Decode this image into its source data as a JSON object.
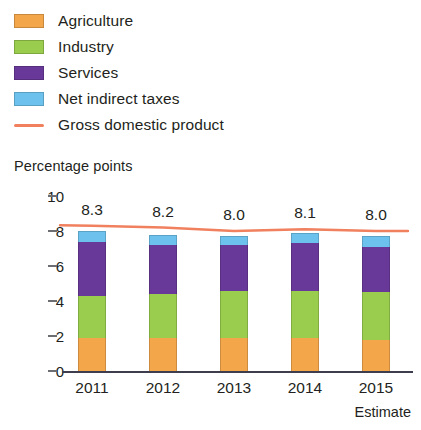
{
  "legend": {
    "items": [
      {
        "label": "Agriculture",
        "color": "#F4A64B",
        "marker": "swatch"
      },
      {
        "label": "Industry",
        "color": "#9ACD4E",
        "marker": "swatch"
      },
      {
        "label": "Services",
        "color": "#69399A",
        "marker": "swatch"
      },
      {
        "label": "Net indirect taxes",
        "color": "#6CC2EC",
        "marker": "swatch"
      },
      {
        "label": "Gross domestic product",
        "color": "#F0805E",
        "marker": "line"
      }
    ]
  },
  "axis_title": "Percentage points",
  "estimate_note": "Estimate",
  "chart_data": {
    "type": "bar",
    "title": "",
    "subtitle": "",
    "xlabel": "",
    "ylabel": "Percentage points",
    "ylim": [
      0,
      10
    ],
    "yticks": [
      0,
      2,
      4,
      6,
      8,
      10
    ],
    "ytick_labels": [
      "0",
      "2",
      "4",
      "6",
      "8",
      "10"
    ],
    "grid": false,
    "stacked": true,
    "legend_position": "top-left",
    "categories": [
      "2011",
      "2012",
      "2013",
      "2014",
      "2015"
    ],
    "category_notes": [
      "",
      "",
      "",
      "",
      "Estimate"
    ],
    "series": [
      {
        "name": "Agriculture",
        "color": "#F4A64B",
        "values": [
          1.9,
          1.9,
          1.9,
          1.9,
          1.8
        ]
      },
      {
        "name": "Industry",
        "color": "#9ACD4E",
        "values": [
          2.4,
          2.5,
          2.7,
          2.7,
          2.7
        ]
      },
      {
        "name": "Services",
        "color": "#69399A",
        "values": [
          3.1,
          2.8,
          2.6,
          2.7,
          2.6
        ]
      },
      {
        "name": "Net indirect taxes",
        "color": "#6CC2EC",
        "values": [
          0.6,
          0.6,
          0.5,
          0.6,
          0.6
        ]
      }
    ],
    "overlay_line": {
      "name": "Gross domestic product",
      "color": "#F0805E",
      "values": [
        8.3,
        8.2,
        8.0,
        8.1,
        8.0
      ]
    },
    "data_labels": [
      "8.3",
      "8.2",
      "8.0",
      "8.1",
      "8.0"
    ]
  }
}
